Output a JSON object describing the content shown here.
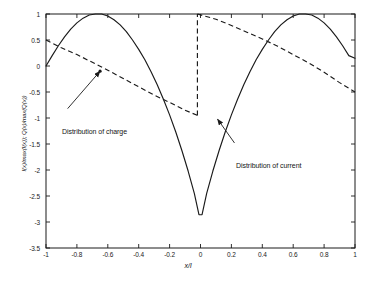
{
  "chart_data": {
    "type": "line",
    "title": "",
    "subtitle": "",
    "xlabel": "x/l",
    "ylabel": "I(x)/max(I(x)); Q(x)/max(Q(x))",
    "xlim": [
      -1,
      1
    ],
    "ylim": [
      -3.5,
      1
    ],
    "xticks": [
      -1,
      -0.8,
      -0.6,
      -0.4,
      -0.2,
      0,
      0.2,
      0.4,
      0.6,
      0.8,
      1
    ],
    "xtick_labels": [
      "-1",
      "-0.8",
      "-0.6",
      "-0.4",
      "-0.2",
      "0",
      "0.2",
      "0.4",
      "0.6",
      "0.8",
      "1"
    ],
    "yticks": [
      1,
      0.5,
      0,
      -0.5,
      -1,
      -1.5,
      -2,
      -2.5,
      -3,
      -3.5
    ],
    "ytick_labels": [
      "1",
      "0.5",
      "0",
      "-0.5",
      "-1",
      "-1.5",
      "-2",
      "-2.5",
      "-3",
      "-3.5"
    ],
    "grid": false,
    "legend": "none",
    "line_color": "#1a1a1a",
    "series": [
      {
        "name": "Distribution of current",
        "style": "solid",
        "x": [
          -1.0,
          -0.96,
          -0.92,
          -0.88,
          -0.84,
          -0.8,
          -0.76,
          -0.72,
          -0.68,
          -0.64,
          -0.6,
          -0.56,
          -0.52,
          -0.48,
          -0.44,
          -0.4,
          -0.36,
          -0.32,
          -0.28,
          -0.24,
          -0.2,
          -0.16,
          -0.12,
          -0.08,
          -0.04,
          -0.01,
          0.01,
          0.04,
          0.08,
          0.12,
          0.16,
          0.2,
          0.24,
          0.28,
          0.32,
          0.36,
          0.4,
          0.44,
          0.48,
          0.52,
          0.56,
          0.6,
          0.64,
          0.68,
          0.72,
          0.76,
          0.8,
          0.84,
          0.88,
          0.92,
          0.96,
          1.0
        ],
        "y": [
          0.0,
          0.2,
          0.39,
          0.56,
          0.71,
          0.83,
          0.92,
          0.98,
          1.0,
          1.0,
          0.96,
          0.89,
          0.79,
          0.66,
          0.5,
          0.32,
          0.12,
          -0.11,
          -0.36,
          -0.64,
          -0.94,
          -1.27,
          -1.63,
          -2.02,
          -2.45,
          -2.86,
          -2.86,
          -2.45,
          -2.02,
          -1.63,
          -1.27,
          -0.94,
          -0.64,
          -0.36,
          -0.11,
          0.12,
          0.32,
          0.5,
          0.66,
          0.79,
          0.89,
          0.96,
          1.0,
          1.0,
          0.98,
          0.92,
          0.83,
          0.71,
          0.56,
          0.39,
          0.2,
          0.15
        ],
        "min_value": -2.95,
        "max_value": 1.0
      },
      {
        "name": "Distribution of charge",
        "style": "dashed",
        "segments": [
          {
            "x": [
              -1.0,
              -0.9,
              -0.8,
              -0.7,
              -0.6,
              -0.5,
              -0.4,
              -0.3,
              -0.2,
              -0.1,
              -0.02
            ],
            "y": [
              0.5,
              0.35,
              0.22,
              0.07,
              -0.08,
              -0.24,
              -0.4,
              -0.56,
              -0.7,
              -0.85,
              -0.95
            ]
          },
          {
            "x": [
              -0.02,
              -0.02
            ],
            "y": [
              -0.95,
              1.0
            ]
          },
          {
            "x": [
              -0.02,
              0.1,
              0.2,
              0.3,
              0.4,
              0.5,
              0.6,
              0.7,
              0.8,
              0.9,
              1.0
            ],
            "y": [
              1.0,
              0.9,
              0.78,
              0.65,
              0.52,
              0.38,
              0.22,
              0.06,
              -0.12,
              -0.32,
              -0.5
            ]
          }
        ]
      }
    ],
    "annotations": [
      {
        "text": "Distribution of charge",
        "text_x": -0.86,
        "text_y": -0.82,
        "point_x": -0.65,
        "point_y": -0.1
      },
      {
        "text": "Distribution of current",
        "text_x": 0.22,
        "text_y": -1.48,
        "point_x": 0.11,
        "point_y": -1.02
      }
    ]
  }
}
